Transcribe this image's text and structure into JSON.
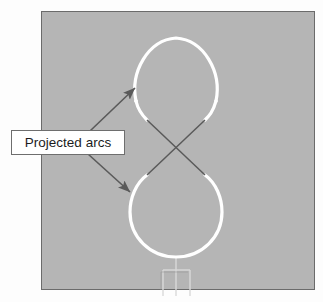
{
  "figure": {
    "title_label": "Projected arcs",
    "panel": {
      "name": "viewport-panel",
      "fill": "#b5b5b5",
      "border": "#6b6b6b",
      "x": 41,
      "y": 11,
      "width": 274,
      "height": 279
    },
    "background": "#fdfdfd",
    "curve": {
      "name": "figure-eight-curve",
      "stroke": "#ffffff",
      "stroke_width": 3,
      "description": "figure-eight / lemniscate of two projected arcs",
      "upper_loop": "teardrop arc",
      "lower_loop": "circular arc"
    },
    "connector_lines": {
      "name": "crossing-lines",
      "stroke": "#5a5a5a",
      "stroke_width": 1.4,
      "crossing_point": {
        "x": 176,
        "y": 147
      }
    },
    "leaders": [
      {
        "name": "leader-arrow-upper",
        "from": {
          "x": 92,
          "y": 132
        },
        "to": {
          "x": 134,
          "y": 88
        },
        "stroke": "#5a5a5a"
      },
      {
        "name": "leader-arrow-lower",
        "from": {
          "x": 90,
          "y": 152
        },
        "to": {
          "x": 129,
          "y": 192
        },
        "stroke": "#5a5a5a"
      }
    ],
    "stem": {
      "name": "axis-stem-marker",
      "stroke": "#d8d8d8",
      "description": "faint rectangular stem below lower loop"
    }
  },
  "callout": {
    "name": "projected-arcs-callout",
    "label": "Projected arcs",
    "fill": "#ffffff",
    "border": "#6e6e6e"
  }
}
